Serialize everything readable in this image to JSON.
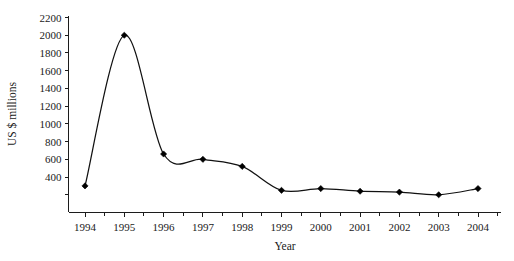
{
  "chart_data": {
    "type": "line",
    "title": "",
    "subtitle": "",
    "xlabel": "Year",
    "ylabel": "US $ millions",
    "x": [
      1994,
      1995,
      1996,
      1997,
      1998,
      1999,
      2000,
      2001,
      2002,
      2003,
      2004
    ],
    "categories": [
      "1994",
      "1995",
      "1996",
      "1997",
      "1998",
      "1999",
      "2000",
      "2001",
      "2002",
      "2003",
      "2004"
    ],
    "values": [
      300,
      2000,
      660,
      600,
      520,
      250,
      270,
      240,
      230,
      200,
      270
    ],
    "series": [
      {
        "name": "US $ millions",
        "values": [
          300,
          2000,
          660,
          600,
          520,
          250,
          270,
          240,
          230,
          200,
          270
        ]
      }
    ],
    "xlim": [
      1993.6,
      1994.0
    ],
    "ylim": [
      0,
      2200
    ],
    "ytick_labels": [
      "2200",
      "2000",
      "1800",
      "1600",
      "1400",
      "1200",
      "1000",
      "800",
      "600",
      "400"
    ],
    "ytick_values": [
      2200,
      2000,
      1800,
      1600,
      1400,
      1200,
      1000,
      800,
      600,
      400
    ],
    "ytick_step": 200,
    "xtick_labels": [
      "1994",
      "1995",
      "1996",
      "1997",
      "1998",
      "1999",
      "2000",
      "2001",
      "2002",
      "2003",
      "2004"
    ],
    "grid": false,
    "legend": false,
    "legend_position": "none",
    "marker": "diamond",
    "line_color": "#111111",
    "marker_color": "#000000",
    "axis_color": "#1c1c1c",
    "background_color": "#ffffff",
    "minor_ticks_x": true,
    "smoothing": "spline",
    "annotations": []
  }
}
